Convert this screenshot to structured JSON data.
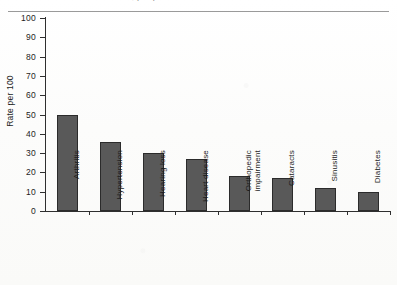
{
  "page": {
    "clipped_caption": "chronic conditions, people 65 and over",
    "background_color": "#fdfdfc"
  },
  "chart_data": {
    "type": "bar",
    "title": "",
    "xlabel": "",
    "ylabel": "Rate per 100",
    "categories": [
      "Arthritis",
      "Hypertension",
      "Hearing loss",
      "Heart disease",
      "Orthopedic impairment",
      "Cataracts",
      "Sinusitis",
      "Diabetes"
    ],
    "values": [
      50,
      36,
      30,
      27,
      18,
      17,
      12,
      10
    ],
    "ylim": [
      0,
      100
    ],
    "ytick_step": 10,
    "yticks": [
      0,
      10,
      20,
      30,
      40,
      50,
      60,
      70,
      80,
      90,
      100
    ],
    "ytick_labels": [
      "0",
      "10",
      "20",
      "30",
      "40",
      "50",
      "60",
      "70",
      "80",
      "90",
      "100"
    ],
    "grid": false,
    "legend": false,
    "bar_color": "#595959",
    "bar_edge_color": "#2b2b2b",
    "axis_color": "#2f2f2f",
    "label_rotation_degrees": 90
  }
}
